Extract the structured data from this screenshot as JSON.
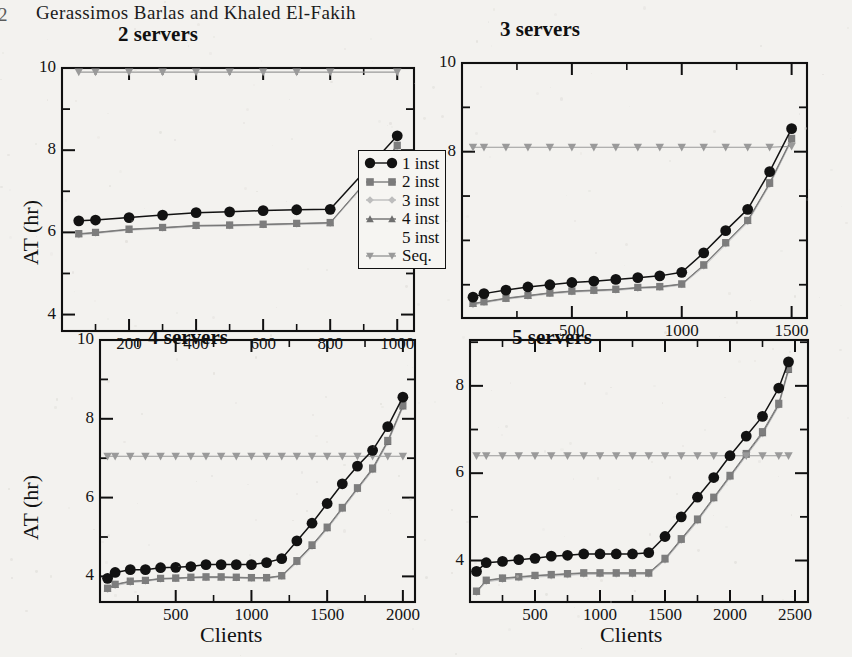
{
  "page": {
    "running_head": "Gerassimos Barlas and Khaled El-Fakih",
    "page_number": "2",
    "background": "#f3f2ef",
    "ink": "#111111"
  },
  "legend": {
    "items": [
      {
        "label": "1 inst",
        "marker": "circle-filled",
        "color": "#121212"
      },
      {
        "label": "2 inst",
        "marker": "square-filled",
        "color": "#7b7b7b"
      },
      {
        "label": "3 inst",
        "marker": "diamond-filled",
        "color": "#bdbdbd"
      },
      {
        "label": "4 inst",
        "marker": "triangle-up-filled",
        "color": "#6f6f6f"
      },
      {
        "label": "5 inst",
        "marker": "none",
        "color": "#cfcfcf"
      },
      {
        "label": "Seq.",
        "marker": "triangle-down-filled",
        "color": "#9a9a9a"
      }
    ]
  },
  "chart_data": [
    {
      "id": "two-servers",
      "type": "line",
      "title": "2 servers",
      "xlabel": "",
      "ylabel": "AT (hr)",
      "xlim": [
        0,
        1050
      ],
      "ylim": [
        3.6,
        10.0
      ],
      "xticks": [
        200,
        400,
        600,
        800,
        1000
      ],
      "yticks": [
        4,
        6,
        8,
        10
      ],
      "yminor": [
        5,
        7,
        9
      ],
      "grid": false,
      "legend_position": "inside-right",
      "x": [
        50,
        100,
        200,
        300,
        400,
        500,
        600,
        700,
        800,
        1000
      ],
      "series": [
        {
          "name": "1 inst",
          "values": [
            6.28,
            6.3,
            6.36,
            6.42,
            6.48,
            6.5,
            6.53,
            6.55,
            6.56,
            8.35
          ]
        },
        {
          "name": "2 inst",
          "values": [
            5.97,
            6.0,
            6.08,
            6.12,
            6.17,
            6.18,
            6.2,
            6.22,
            6.24,
            8.12
          ]
        },
        {
          "name": "3 inst",
          "values": [
            5.94,
            5.98,
            6.06,
            6.1,
            6.15,
            6.16,
            6.18,
            6.2,
            6.22,
            8.08
          ]
        },
        {
          "name": "4 inst",
          "values": [
            5.96,
            5.99,
            6.07,
            6.11,
            6.16,
            6.17,
            6.19,
            6.21,
            6.23,
            8.1
          ]
        },
        {
          "name": "5 inst",
          "values": [
            5.93,
            5.97,
            6.05,
            6.09,
            6.14,
            6.15,
            6.17,
            6.19,
            6.21,
            8.06
          ]
        },
        {
          "name": "Seq.",
          "values": [
            9.9,
            9.9,
            9.9,
            9.9,
            9.9,
            9.9,
            9.9,
            9.9,
            9.9,
            9.9
          ]
        }
      ]
    },
    {
      "id": "three-servers",
      "type": "line",
      "title": "3 servers",
      "xlabel": "",
      "ylabel": "",
      "xlim": [
        0,
        1570
      ],
      "ylim": [
        4.25,
        10.0
      ],
      "xticks": [
        500,
        1000,
        1500
      ],
      "yticks": [
        8,
        10
      ],
      "yminor": [
        5,
        6,
        7,
        9
      ],
      "grid": false,
      "legend_position": "none",
      "x": [
        50,
        100,
        200,
        300,
        400,
        500,
        600,
        700,
        800,
        900,
        1000,
        1100,
        1200,
        1300,
        1400,
        1500
      ],
      "series": [
        {
          "name": "1 inst",
          "values": [
            4.72,
            4.8,
            4.88,
            4.95,
            5.0,
            5.05,
            5.08,
            5.12,
            5.16,
            5.2,
            5.28,
            5.72,
            6.22,
            6.7,
            7.55,
            8.52
          ]
        },
        {
          "name": "2 inst",
          "values": [
            4.58,
            4.62,
            4.7,
            4.76,
            4.82,
            4.86,
            4.88,
            4.9,
            4.94,
            4.96,
            5.02,
            5.45,
            5.95,
            6.45,
            7.3,
            8.3
          ]
        },
        {
          "name": "3 inst",
          "values": [
            4.55,
            4.6,
            4.68,
            4.74,
            4.8,
            4.84,
            4.86,
            4.88,
            4.92,
            4.94,
            5.0,
            5.42,
            5.92,
            6.42,
            7.26,
            8.26
          ]
        },
        {
          "name": "4 inst",
          "values": [
            4.57,
            4.61,
            4.69,
            4.75,
            4.81,
            4.85,
            4.87,
            4.89,
            4.93,
            4.95,
            5.01,
            5.44,
            5.94,
            6.44,
            7.28,
            8.28
          ]
        },
        {
          "name": "5 inst",
          "values": [
            4.54,
            4.59,
            4.67,
            4.73,
            4.79,
            4.83,
            4.85,
            4.87,
            4.91,
            4.93,
            4.99,
            5.4,
            5.9,
            6.4,
            7.24,
            8.24
          ]
        },
        {
          "name": "Seq.",
          "values": [
            8.1,
            8.1,
            8.1,
            8.1,
            8.1,
            8.1,
            8.1,
            8.1,
            8.1,
            8.1,
            8.1,
            8.1,
            8.1,
            8.1,
            8.1,
            8.12
          ]
        }
      ]
    },
    {
      "id": "four-servers",
      "type": "line",
      "title": "4 servers",
      "xlabel": "Clients",
      "ylabel": "AT (hr)",
      "xlim": [
        0,
        2080
      ],
      "ylim": [
        3.35,
        10.0
      ],
      "xticks": [
        500,
        1000,
        1500,
        2000
      ],
      "yticks": [
        4,
        6,
        8,
        10
      ],
      "yminor": [
        5,
        7,
        9
      ],
      "grid": false,
      "legend_position": "none",
      "x": [
        50,
        100,
        200,
        300,
        400,
        500,
        600,
        700,
        800,
        900,
        1000,
        1100,
        1200,
        1300,
        1400,
        1500,
        1600,
        1700,
        1800,
        1900,
        2000
      ],
      "series": [
        {
          "name": "1 inst",
          "values": [
            3.95,
            4.1,
            4.17,
            4.17,
            4.22,
            4.23,
            4.25,
            4.3,
            4.3,
            4.3,
            4.3,
            4.35,
            4.45,
            4.9,
            5.35,
            5.85,
            6.35,
            6.8,
            7.2,
            7.8,
            8.55
          ]
        },
        {
          "name": "2 inst",
          "values": [
            3.7,
            3.8,
            3.88,
            3.9,
            3.95,
            3.96,
            3.98,
            3.99,
            3.99,
            3.98,
            3.97,
            3.97,
            4.02,
            4.4,
            4.8,
            5.25,
            5.75,
            6.25,
            6.75,
            7.45,
            8.35
          ]
        },
        {
          "name": "3 inst",
          "values": [
            3.67,
            3.77,
            3.85,
            3.88,
            3.93,
            3.94,
            3.96,
            3.97,
            3.97,
            3.96,
            3.95,
            3.95,
            4.0,
            4.36,
            4.76,
            5.21,
            5.71,
            6.21,
            6.7,
            7.4,
            8.3
          ]
        },
        {
          "name": "4 inst",
          "values": [
            3.69,
            3.79,
            3.87,
            3.89,
            3.94,
            3.95,
            3.97,
            3.98,
            3.98,
            3.97,
            3.96,
            3.96,
            4.01,
            4.38,
            4.78,
            5.23,
            5.73,
            6.23,
            6.72,
            7.42,
            8.32
          ]
        },
        {
          "name": "5 inst",
          "values": [
            3.66,
            3.76,
            3.84,
            3.87,
            3.92,
            3.93,
            3.95,
            3.96,
            3.96,
            3.95,
            3.94,
            3.94,
            3.99,
            4.34,
            4.74,
            5.19,
            5.69,
            6.19,
            6.68,
            7.38,
            8.28
          ]
        },
        {
          "name": "Seq.",
          "values": [
            7.05,
            7.05,
            7.05,
            7.05,
            7.05,
            7.05,
            7.05,
            7.05,
            7.05,
            7.05,
            7.05,
            7.05,
            7.05,
            7.05,
            7.05,
            7.05,
            7.05,
            7.05,
            7.05,
            7.05,
            7.05
          ]
        }
      ]
    },
    {
      "id": "five-servers",
      "type": "line",
      "title": "5 servers",
      "xlabel": "Clients",
      "ylabel": "",
      "xlim": [
        0,
        2600
      ],
      "ylim": [
        3.05,
        9.05
      ],
      "xticks": [
        500,
        1000,
        1500,
        2000,
        2500
      ],
      "yticks": [
        4,
        6,
        8
      ],
      "yminor": [
        5,
        7,
        9
      ],
      "grid": false,
      "legend_position": "none",
      "x": [
        50,
        125,
        250,
        375,
        500,
        625,
        750,
        875,
        1000,
        1125,
        1250,
        1375,
        1500,
        1625,
        1750,
        1875,
        2000,
        2125,
        2250,
        2375,
        2450
      ],
      "series": [
        {
          "name": "1 inst",
          "values": [
            3.75,
            3.95,
            3.98,
            4.02,
            4.05,
            4.1,
            4.12,
            4.15,
            4.15,
            4.15,
            4.15,
            4.18,
            4.55,
            5.0,
            5.45,
            5.9,
            6.4,
            6.85,
            7.3,
            7.95,
            8.55
          ]
        },
        {
          "name": "2 inst",
          "values": [
            3.3,
            3.55,
            3.6,
            3.63,
            3.66,
            3.68,
            3.7,
            3.72,
            3.72,
            3.72,
            3.72,
            3.72,
            4.05,
            4.5,
            4.95,
            5.45,
            5.95,
            6.45,
            6.95,
            7.6,
            8.4
          ]
        },
        {
          "name": "3 inst",
          "values": [
            3.27,
            3.52,
            3.57,
            3.6,
            3.63,
            3.65,
            3.67,
            3.69,
            3.69,
            3.69,
            3.69,
            3.69,
            4.01,
            4.46,
            4.91,
            5.41,
            5.91,
            6.41,
            6.9,
            7.55,
            8.35
          ]
        },
        {
          "name": "4 inst",
          "values": [
            3.29,
            3.54,
            3.59,
            3.62,
            3.65,
            3.67,
            3.69,
            3.71,
            3.71,
            3.71,
            3.71,
            3.71,
            4.03,
            4.48,
            4.93,
            5.43,
            5.93,
            6.43,
            6.92,
            7.57,
            8.37
          ]
        },
        {
          "name": "5 inst",
          "values": [
            3.26,
            3.51,
            3.56,
            3.59,
            3.62,
            3.64,
            3.66,
            3.68,
            3.68,
            3.68,
            3.68,
            3.68,
            4.0,
            4.44,
            4.89,
            5.39,
            5.89,
            6.39,
            6.88,
            7.53,
            8.33
          ]
        },
        {
          "name": "Seq.",
          "values": [
            6.4,
            6.4,
            6.4,
            6.4,
            6.4,
            6.4,
            6.4,
            6.4,
            6.4,
            6.4,
            6.4,
            6.4,
            6.4,
            6.4,
            6.4,
            6.4,
            6.4,
            6.4,
            6.4,
            6.4,
            6.4
          ]
        }
      ]
    }
  ]
}
